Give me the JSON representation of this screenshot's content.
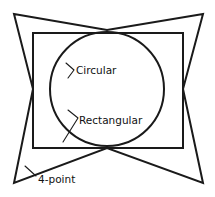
{
  "figure": {
    "background_color": "#ffffff",
    "stroke_color": "#1a1a1a",
    "text_color": "#111111",
    "canvas": {
      "width": 215,
      "height": 197
    },
    "labels": {
      "circular": "Circular",
      "rectangular": "Rectangular",
      "four_point": "4-point"
    },
    "shapes": {
      "star": {
        "name": "4-point",
        "points": "14,14 107,30 203,14 183,89 203,183 107,148 14,183 33,89",
        "tips": [
          [
            14,
            14
          ],
          [
            203,
            14
          ],
          [
            203,
            183
          ],
          [
            14,
            183
          ]
        ],
        "concave_vertices": [
          [
            107,
            30
          ],
          [
            183,
            89
          ],
          [
            107,
            148
          ],
          [
            33,
            89
          ]
        ]
      },
      "rectangle": {
        "name": "Rectangular",
        "x": 33,
        "y": 33,
        "width": 150,
        "height": 115
      },
      "circle": {
        "name": "Circular",
        "cx": 107,
        "cy": 89,
        "r": 57
      }
    },
    "leaders": {
      "circular": {
        "path": "M 74,70 L 66,63 M 74,70 L 68,78"
      },
      "rectangular": {
        "path": "M 78,118 L 68,110 M 78,118 L 63,142"
      },
      "four_point": {
        "path": "M 36,176 L 25,166"
      }
    },
    "label_positions": {
      "circular": {
        "x": 76,
        "y": 74
      },
      "rectangular": {
        "x": 79,
        "y": 124
      },
      "four_point": {
        "x": 38,
        "y": 183
      }
    }
  }
}
